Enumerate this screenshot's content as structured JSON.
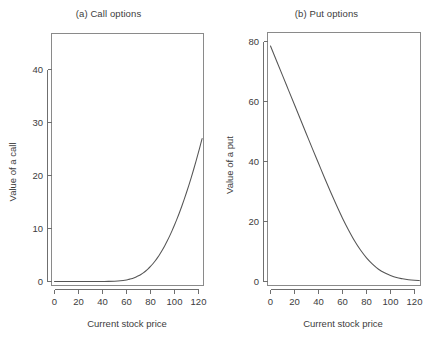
{
  "figure": {
    "width": 435,
    "height": 340,
    "background": "#ffffff",
    "line_color": "#555555",
    "axis_color": "#6f6f6f",
    "text_color": "#3c3c3c"
  },
  "chart_data": [
    {
      "type": "line",
      "panel": "a",
      "title": "(a) Call options",
      "xlabel": "Current stock price",
      "ylabel": "Value of a call",
      "xlim": [
        -2,
        126
      ],
      "ylim": [
        -1.5,
        47
      ],
      "xticks": [
        0,
        20,
        40,
        60,
        80,
        100,
        120
      ],
      "xticklabels": [
        "0",
        "20",
        "40",
        "60",
        "80",
        "100",
        "120"
      ],
      "yticks": [
        0,
        10,
        20,
        30,
        40
      ],
      "yticklabels": [
        "0",
        "10",
        "20",
        "30",
        "40"
      ],
      "grid": false,
      "legend": null,
      "series": [
        {
          "name": "Value of a call",
          "x": [
            0,
            5,
            10,
            15,
            20,
            25,
            30,
            35,
            40,
            45,
            50,
            55,
            60,
            62,
            64,
            66,
            68,
            70,
            72,
            74,
            76,
            78,
            80,
            82,
            84,
            86,
            88,
            90,
            92,
            94,
            96,
            98,
            100,
            102,
            104,
            106,
            108,
            110,
            112,
            114,
            116,
            118,
            120,
            122,
            123
          ],
          "y": [
            0.0,
            0.0,
            0.0,
            0.0,
            0.0,
            0.0,
            0.0,
            0.0,
            0.01,
            0.02,
            0.06,
            0.14,
            0.3,
            0.4,
            0.52,
            0.67,
            0.85,
            1.07,
            1.33,
            1.63,
            1.98,
            2.38,
            2.84,
            3.35,
            3.92,
            4.55,
            5.24,
            5.99,
            6.8,
            7.68,
            8.61,
            9.6,
            10.65,
            11.76,
            12.93,
            14.16,
            15.45,
            16.8,
            18.2,
            19.66,
            21.18,
            22.76,
            24.4,
            26.1,
            26.97
          ]
        }
      ]
    },
    {
      "type": "line",
      "panel": "b",
      "title": "(b) Put options",
      "xlabel": "Current stock price",
      "ylabel": "Value of a put",
      "xlim": [
        -2,
        126
      ],
      "ylim": [
        -2.5,
        82
      ],
      "xticks": [
        0,
        20,
        40,
        60,
        80,
        100,
        120
      ],
      "xticklabels": [
        "0",
        "20",
        "40",
        "60",
        "80",
        "100",
        "120"
      ],
      "yticks": [
        0,
        20,
        40,
        60,
        80
      ],
      "yticklabels": [
        "0",
        "20",
        "40",
        "60",
        "80"
      ],
      "grid": false,
      "legend": null,
      "series": [
        {
          "name": "Value of a put",
          "x": [
            0,
            5,
            10,
            15,
            20,
            25,
            30,
            35,
            40,
            45,
            50,
            55,
            60,
            65,
            70,
            75,
            80,
            85,
            90,
            95,
            100,
            105,
            110,
            115,
            120,
            124
          ],
          "y": [
            78.5,
            73.6,
            68.7,
            63.8,
            58.9,
            54.0,
            49.1,
            44.2,
            39.4,
            34.6,
            29.9,
            25.4,
            21.1,
            17.2,
            13.6,
            10.5,
            7.9,
            5.8,
            4.1,
            2.9,
            2.0,
            1.3,
            0.9,
            0.6,
            0.4,
            0.3
          ]
        }
      ]
    }
  ]
}
